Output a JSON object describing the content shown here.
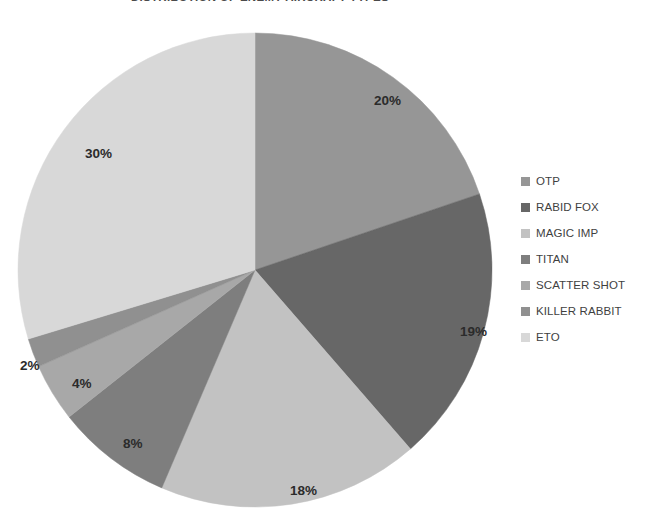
{
  "chart_data": {
    "type": "pie",
    "title": "DISTRIBUTION OF ENEMY AIRCRAFT TYPES",
    "xlabel": "",
    "ylabel": "",
    "legend_position": "right",
    "grid": false,
    "categories": [
      "OTP",
      "RABID FOX",
      "MAGIC IMP",
      "TITAN",
      "SCATTER SHOT",
      "KILLER RABBIT",
      "ETO"
    ],
    "values": [
      20,
      19,
      18,
      8,
      4,
      2,
      30
    ],
    "data_labels": [
      "20%",
      "19%",
      "18%",
      "8%",
      "4%",
      "2%",
      "30%"
    ],
    "units": "percent",
    "start_angle_deg": 0,
    "direction": "clockwise",
    "slices": [
      {
        "label": "OTP",
        "value": 20,
        "data_label": "20%",
        "color": "#969696",
        "label_x": 374,
        "label_y": 105
      },
      {
        "label": "RABID FOX",
        "value": 19,
        "data_label": "19%",
        "color": "#676767",
        "label_x": 460,
        "label_y": 336
      },
      {
        "label": "MAGIC IMP",
        "value": 18,
        "data_label": "18%",
        "color": "#c2c2c2",
        "label_x": 290,
        "label_y": 495
      },
      {
        "label": "TITAN",
        "value": 8,
        "data_label": "8%",
        "color": "#7e7e7e",
        "label_x": 123,
        "label_y": 448
      },
      {
        "label": "SCATTER SHOT",
        "value": 4,
        "data_label": "4%",
        "color": "#a8a8a8",
        "label_x": 72,
        "label_y": 388
      },
      {
        "label": "KILLER RABBIT",
        "value": 2,
        "data_label": "2%",
        "color": "#909090",
        "label_x": 20,
        "label_y": 370
      },
      {
        "label": "ETO",
        "value": 30,
        "data_label": "30%",
        "color": "#d8d8d8",
        "label_x": 85,
        "label_y": 158
      }
    ]
  },
  "legend": {
    "items": [
      {
        "label": "OTP",
        "color": "#969696"
      },
      {
        "label": "RABID FOX",
        "color": "#676767"
      },
      {
        "label": "MAGIC IMP",
        "color": "#c2c2c2"
      },
      {
        "label": "TITAN",
        "color": "#7e7e7e"
      },
      {
        "label": "SCATTER SHOT",
        "color": "#a8a8a8"
      },
      {
        "label": "KILLER RABBIT",
        "color": "#909090"
      },
      {
        "label": "ETO",
        "color": "#d8d8d8"
      }
    ]
  },
  "geometry": {
    "center_x": 255,
    "center_y": 270,
    "radius": 237
  }
}
